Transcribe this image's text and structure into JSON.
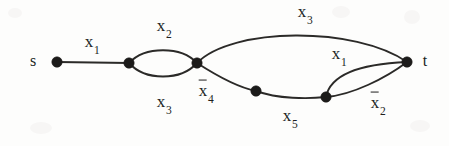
{
  "diagram": {
    "type": "series-parallel-graph",
    "title_terminals": {
      "source": "s",
      "sink": "t"
    },
    "background_color": "#fdfdfc",
    "stroke_color": "#2b2a28",
    "node_color": "#1c1b1a",
    "nodes": [
      {
        "id": "s",
        "label": "s",
        "x": 57,
        "y": 62
      },
      {
        "id": "n1",
        "label": "",
        "x": 129,
        "y": 63
      },
      {
        "id": "n2",
        "label": "",
        "x": 197,
        "y": 63
      },
      {
        "id": "n3",
        "label": "",
        "x": 256,
        "y": 91
      },
      {
        "id": "n4",
        "label": "",
        "x": 326,
        "y": 97
      },
      {
        "id": "t",
        "label": "t",
        "x": 407,
        "y": 62
      }
    ],
    "edges": [
      {
        "id": "e1",
        "from": "s",
        "to": "n1",
        "label": "x",
        "subscript": "1",
        "overline": false,
        "label_x": 92,
        "label_y": 43
      },
      {
        "id": "e2",
        "from": "n1",
        "to": "n2",
        "label": "x",
        "subscript": "2",
        "overline": false,
        "label_x": 164,
        "label_y": 27
      },
      {
        "id": "e3",
        "from": "n1",
        "to": "n2",
        "label": "x",
        "subscript": "3",
        "overline": false,
        "label_x": 164,
        "label_y": 103
      },
      {
        "id": "e4",
        "from": "n2",
        "to": "t",
        "label": "x",
        "subscript": "3",
        "overline": false,
        "label_x": 305,
        "label_y": 13
      },
      {
        "id": "e5",
        "from": "n2",
        "to": "n3",
        "label": "x",
        "subscript": "4",
        "overline": true,
        "label_x": 206,
        "label_y": 92
      },
      {
        "id": "e6",
        "from": "n3",
        "to": "n4",
        "label": "x",
        "subscript": "5",
        "overline": false,
        "label_x": 290,
        "label_y": 117
      },
      {
        "id": "e7",
        "from": "n4",
        "to": "t",
        "label": "x",
        "subscript": "1",
        "overline": false,
        "label_x": 339,
        "label_y": 55
      },
      {
        "id": "e8",
        "from": "n4",
        "to": "t",
        "label": "x",
        "subscript": "2",
        "overline": true,
        "label_x": 378,
        "label_y": 104
      }
    ],
    "paths": {
      "s_to_n1": "M 57 62 L 129 63",
      "n1_to_n2_upper": "M 129 63 C 145 46, 181 46, 197 63",
      "n1_to_n2_lower": "M 129 63 C 145 81, 181 81, 197 63",
      "n2_to_t_arc": "M 197 63 C 232 27, 355 26, 407 62",
      "n2_to_n3": "M 197 63 C 214 74, 236 87, 256 91",
      "n3_to_n4": "M 256 91 C 278 99, 308 99, 326 97",
      "n4_to_t_upper": "M 326 97 C 330 76, 358 64, 407 62",
      "n4_to_t_lower": "M 326 97 C 352 95, 386 78, 407 62"
    },
    "node_radius": 5.2,
    "terminal_label_offsets": {
      "s_label_x": 33,
      "s_label_y": 61,
      "t_label_x": 425,
      "t_label_y": 61
    }
  }
}
